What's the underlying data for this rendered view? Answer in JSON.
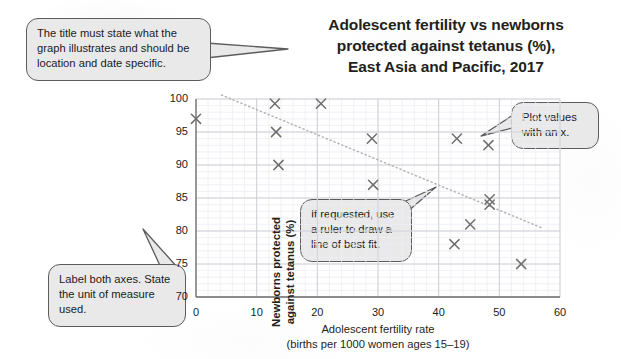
{
  "title": {
    "line1": "Adolescent fertility vs newborns",
    "line2": "protected against tetanus (%),",
    "line3": "East Asia and Pacific, 2017"
  },
  "callouts": [
    {
      "id": "title-callout",
      "text": "The title must state what the graph illustrates and should be location and date specific."
    },
    {
      "id": "axes-callout",
      "text": "Label both axes. State the unit of measure used."
    },
    {
      "id": "bestfit-callout",
      "text": "If requested, use a ruler to draw a line of best fit."
    },
    {
      "id": "plotvalues-callout",
      "text": "Plot values with an x."
    }
  ],
  "chart_data": {
    "type": "scatter",
    "title": "Adolescent fertility vs newborns protected against tetanus (%), East Asia and Pacific, 2017",
    "xlabel": "Adolescent fertility rate",
    "xlabel_sub": "(births per 1000 women ages 15–19)",
    "ylabel": "Newborns protected against tetanus (%)",
    "ylabel_line1": "Newborns protected",
    "ylabel_line2": "against tetanus (%)",
    "xlim": [
      0,
      60
    ],
    "ylim": [
      70,
      100
    ],
    "xticks": [
      0,
      10,
      20,
      30,
      40,
      50,
      60
    ],
    "yticks": [
      70,
      75,
      80,
      85,
      90,
      95,
      100
    ],
    "xtick_labels": [
      "0",
      "10",
      "20",
      "30",
      "40",
      "50",
      "60"
    ],
    "ytick_labels": [
      "70",
      "75",
      "80",
      "85",
      "90",
      "95",
      "100"
    ],
    "grid": true,
    "minor_grid": true,
    "legend": "none",
    "marker": "x",
    "marker_color": "#6e6e6e",
    "points": [
      {
        "x": 0.0,
        "y": 97.0
      },
      {
        "x": 13.0,
        "y": 99.3
      },
      {
        "x": 13.2,
        "y": 95.0
      },
      {
        "x": 13.6,
        "y": 90.0
      },
      {
        "x": 20.6,
        "y": 99.3
      },
      {
        "x": 29.0,
        "y": 94.0
      },
      {
        "x": 29.2,
        "y": 87.0
      },
      {
        "x": 43.0,
        "y": 94.0
      },
      {
        "x": 48.2,
        "y": 93.0
      },
      {
        "x": 48.4,
        "y": 84.8
      },
      {
        "x": 48.4,
        "y": 84.0
      },
      {
        "x": 45.2,
        "y": 81.0
      },
      {
        "x": 42.6,
        "y": 78.0
      },
      {
        "x": 53.6,
        "y": 75.0
      }
    ],
    "trendline": {
      "style": "dotted",
      "color": "#b4b4b4",
      "x0": 4.2,
      "y0": 100.6,
      "x1": 57.2,
      "y1": 80.4
    }
  }
}
